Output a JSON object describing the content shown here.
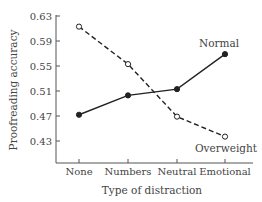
{
  "chart_data": {
    "type": "line",
    "title": "",
    "xlabel": "Type of distraction",
    "ylabel": "Proofreading accuracy",
    "categories": [
      "None",
      "Numbers",
      "Neutral",
      "Emotional"
    ],
    "ylim": [
      0.39,
      0.63
    ],
    "yticks": [
      "0.63",
      "0.59",
      "0.55",
      "0.51",
      "0.47",
      "0.43"
    ],
    "grid": false,
    "legend": "inline labels near line ends",
    "series": [
      {
        "name": "Normal",
        "style": "solid",
        "marker": "filled-circle",
        "values": [
          0.472,
          0.503,
          0.513,
          0.569
        ]
      },
      {
        "name": "Overweight",
        "style": "dashed",
        "marker": "open-circle",
        "values": [
          0.613,
          0.553,
          0.469,
          0.437
        ]
      }
    ]
  },
  "colors": {
    "line": "#222222",
    "axis": "#555555",
    "text": "#444444"
  }
}
